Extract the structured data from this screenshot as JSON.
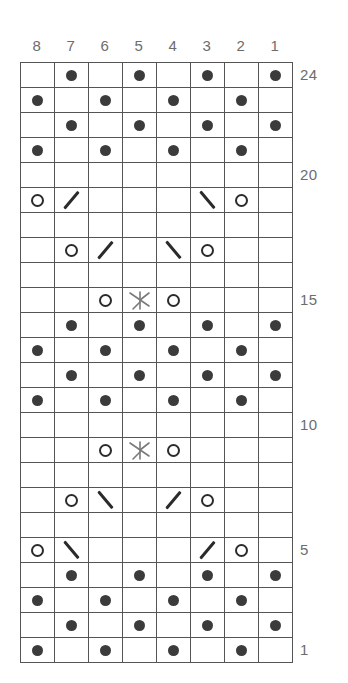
{
  "chart_data": {
    "type": "table",
    "stitches": 8,
    "rows": 24,
    "column_headers": [
      "8",
      "7",
      "6",
      "5",
      "4",
      "3",
      "2",
      "1"
    ],
    "row_labels_shown": [
      "24",
      "20",
      "15",
      "10",
      "5",
      "1"
    ],
    "symbol_legend": {
      "purl": "purl-dot",
      "yo": "yarn-over-circle",
      "k2tog": "right-slant-decrease",
      "ssk": "left-slant-decrease",
      "cdd": "central-double-decrease",
      "blank": "knit-empty"
    },
    "grid": [
      {
        "row": 24,
        "label": "24",
        "cells": [
          "blank",
          "purl",
          "blank",
          "purl",
          "blank",
          "purl",
          "blank",
          "purl"
        ]
      },
      {
        "row": 23,
        "label": "",
        "cells": [
          "purl",
          "blank",
          "purl",
          "blank",
          "purl",
          "blank",
          "purl",
          "blank"
        ]
      },
      {
        "row": 22,
        "label": "",
        "cells": [
          "blank",
          "purl",
          "blank",
          "purl",
          "blank",
          "purl",
          "blank",
          "purl"
        ]
      },
      {
        "row": 21,
        "label": "",
        "cells": [
          "purl",
          "blank",
          "purl",
          "blank",
          "purl",
          "blank",
          "purl",
          "blank"
        ]
      },
      {
        "row": 20,
        "label": "20",
        "cells": [
          "blank",
          "blank",
          "blank",
          "blank",
          "blank",
          "blank",
          "blank",
          "blank"
        ]
      },
      {
        "row": 19,
        "label": "",
        "cells": [
          "yo",
          "ssk",
          "blank",
          "blank",
          "blank",
          "k2tog",
          "yo",
          "blank"
        ]
      },
      {
        "row": 18,
        "label": "",
        "cells": [
          "blank",
          "blank",
          "blank",
          "blank",
          "blank",
          "blank",
          "blank",
          "blank"
        ]
      },
      {
        "row": 17,
        "label": "",
        "cells": [
          "blank",
          "yo",
          "ssk",
          "blank",
          "k2tog",
          "yo",
          "blank",
          "blank"
        ]
      },
      {
        "row": 16,
        "label": "",
        "cells": [
          "blank",
          "blank",
          "blank",
          "blank",
          "blank",
          "blank",
          "blank",
          "blank"
        ]
      },
      {
        "row": 15,
        "label": "15",
        "cells": [
          "blank",
          "blank",
          "yo",
          "cdd",
          "yo",
          "blank",
          "blank",
          "blank"
        ]
      },
      {
        "row": 14,
        "label": "",
        "cells": [
          "blank",
          "purl",
          "blank",
          "purl",
          "blank",
          "purl",
          "blank",
          "purl"
        ]
      },
      {
        "row": 13,
        "label": "",
        "cells": [
          "purl",
          "blank",
          "purl",
          "blank",
          "purl",
          "blank",
          "purl",
          "blank"
        ]
      },
      {
        "row": 12,
        "label": "",
        "cells": [
          "blank",
          "purl",
          "blank",
          "purl",
          "blank",
          "purl",
          "blank",
          "purl"
        ]
      },
      {
        "row": 11,
        "label": "",
        "cells": [
          "purl",
          "blank",
          "purl",
          "blank",
          "purl",
          "blank",
          "purl",
          "blank"
        ]
      },
      {
        "row": 10,
        "label": "10",
        "cells": [
          "blank",
          "blank",
          "blank",
          "blank",
          "blank",
          "blank",
          "blank",
          "blank"
        ]
      },
      {
        "row": 9,
        "label": "",
        "cells": [
          "blank",
          "blank",
          "yo",
          "cdd",
          "yo",
          "blank",
          "blank",
          "blank"
        ]
      },
      {
        "row": 8,
        "label": "",
        "cells": [
          "blank",
          "blank",
          "blank",
          "blank",
          "blank",
          "blank",
          "blank",
          "blank"
        ]
      },
      {
        "row": 7,
        "label": "",
        "cells": [
          "blank",
          "yo",
          "k2tog",
          "blank",
          "ssk",
          "yo",
          "blank",
          "blank"
        ]
      },
      {
        "row": 6,
        "label": "",
        "cells": [
          "blank",
          "blank",
          "blank",
          "blank",
          "blank",
          "blank",
          "blank",
          "blank"
        ]
      },
      {
        "row": 5,
        "label": "5",
        "cells": [
          "yo",
          "k2tog",
          "blank",
          "blank",
          "blank",
          "ssk",
          "yo",
          "blank"
        ]
      },
      {
        "row": 4,
        "label": "",
        "cells": [
          "blank",
          "purl",
          "blank",
          "purl",
          "blank",
          "purl",
          "blank",
          "purl"
        ]
      },
      {
        "row": 3,
        "label": "",
        "cells": [
          "purl",
          "blank",
          "purl",
          "blank",
          "purl",
          "blank",
          "purl",
          "blank"
        ]
      },
      {
        "row": 2,
        "label": "",
        "cells": [
          "blank",
          "purl",
          "blank",
          "purl",
          "blank",
          "purl",
          "blank",
          "purl"
        ]
      },
      {
        "row": 1,
        "label": "1",
        "cells": [
          "purl",
          "blank",
          "purl",
          "blank",
          "purl",
          "blank",
          "purl",
          "blank"
        ]
      }
    ]
  },
  "colors": {
    "grid_line": "#555555",
    "symbol": "#2b2b2b",
    "purl_dot": "#3b3b3b",
    "label_text": "#6d6d6d",
    "background": "#ffffff"
  }
}
